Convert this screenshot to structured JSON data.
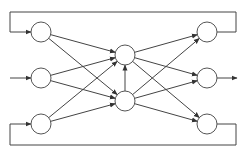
{
  "diagram": {
    "type": "neural-network",
    "colors": {
      "stroke": "#444444",
      "node_fill": "#ffffff",
      "background": "#ffffff"
    },
    "node_radius": 10,
    "layers": [
      {
        "name": "input",
        "nodes": [
          {
            "id": "i1",
            "x": 41,
            "y": 32
          },
          {
            "id": "i2",
            "x": 41,
            "y": 78
          },
          {
            "id": "i3",
            "x": 41,
            "y": 124
          }
        ]
      },
      {
        "name": "hidden",
        "nodes": [
          {
            "id": "h1",
            "x": 125,
            "y": 55
          },
          {
            "id": "h2",
            "x": 125,
            "y": 101
          }
        ]
      },
      {
        "name": "output",
        "nodes": [
          {
            "id": "o1",
            "x": 207,
            "y": 32
          },
          {
            "id": "o2",
            "x": 207,
            "y": 78
          },
          {
            "id": "o3",
            "x": 207,
            "y": 124
          }
        ]
      }
    ],
    "edges": [
      [
        "i1",
        "h1"
      ],
      [
        "i1",
        "h2"
      ],
      [
        "i2",
        "h1"
      ],
      [
        "i2",
        "h2"
      ],
      [
        "i3",
        "h1"
      ],
      [
        "i3",
        "h2"
      ],
      [
        "h1",
        "o1"
      ],
      [
        "h1",
        "o2"
      ],
      [
        "h1",
        "o3"
      ],
      [
        "h2",
        "o1"
      ],
      [
        "h2",
        "o2"
      ],
      [
        "h2",
        "o3"
      ],
      [
        "h2",
        "h1"
      ]
    ],
    "external_input": {
      "from": [
        10,
        78
      ],
      "to": "i2"
    },
    "external_output": {
      "from": "o2",
      "to": [
        237,
        78
      ]
    },
    "feedback_loops": [
      {
        "name": "top",
        "from": "o1",
        "to": "i1",
        "path": [
          [
            217,
            32
          ],
          [
            236,
            32
          ],
          [
            236,
            12
          ],
          [
            10,
            12
          ],
          [
            10,
            32
          ],
          [
            31,
            32
          ]
        ]
      },
      {
        "name": "bottom",
        "from": "o3",
        "to": "i3",
        "path": [
          [
            217,
            124
          ],
          [
            236,
            124
          ],
          [
            236,
            145
          ],
          [
            10,
            145
          ],
          [
            10,
            124
          ],
          [
            31,
            124
          ]
        ]
      }
    ]
  }
}
